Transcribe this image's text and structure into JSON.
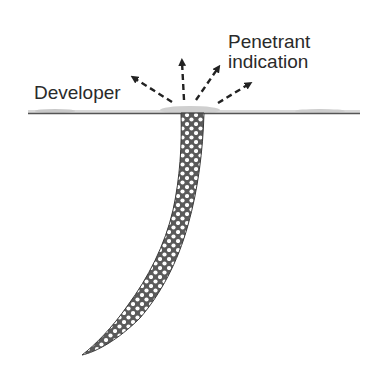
{
  "diagram": {
    "labels": {
      "developer": "Developer",
      "penetrant_line1": "Penetrant",
      "penetrant_line2": "indication"
    },
    "elements": {
      "surface": "surface-line-with-developer-layer",
      "crack": "penetrant-filled-crack",
      "arrows": [
        "arrow-up-left",
        "arrow-up",
        "arrow-up-right",
        "arrow-right-up"
      ]
    },
    "colors": {
      "text": "#2a2a2a",
      "surface_line": "#555555",
      "developer_layer": "#cfcfcf",
      "crack_fill": "#5a5a5a",
      "crack_dots": "#ffffff",
      "arrows": "#222222"
    }
  }
}
